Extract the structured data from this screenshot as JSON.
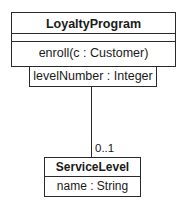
{
  "diagram": {
    "type": "uml-class-diagram",
    "classes": [
      {
        "name": "LoyaltyProgram",
        "attributes": [],
        "operations": [
          "enroll(c : Customer)"
        ],
        "qualifier": "levelNumber : Integer"
      },
      {
        "name": "ServiceLevel",
        "attributes": [
          "name : String"
        ],
        "operations": []
      }
    ],
    "associations": [
      {
        "from": "LoyaltyProgram",
        "to": "ServiceLevel",
        "qualifier": "levelNumber : Integer",
        "target_multiplicity": "0..1"
      }
    ],
    "colors": {
      "line": "#2a2a2a",
      "background": "#ffffff",
      "text": "#1a1a1a"
    }
  }
}
